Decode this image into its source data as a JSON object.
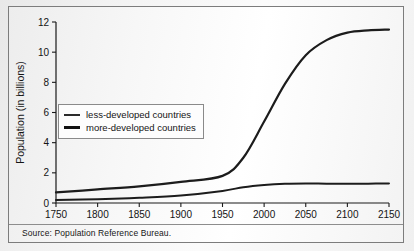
{
  "figure": {
    "source_note": "Source: Population Reference Bureau."
  },
  "chart_data": {
    "type": "line",
    "title": "",
    "xlabel": "",
    "ylabel": "Population (in billions)",
    "xlim": [
      1750,
      2150
    ],
    "ylim": [
      0,
      12
    ],
    "grid": false,
    "legend_position": "upper-left-inside",
    "xticks": [
      1750,
      1800,
      1850,
      1900,
      1950,
      2000,
      2050,
      2100,
      2150
    ],
    "yticks": [
      0,
      2,
      4,
      6,
      8,
      10,
      12
    ],
    "x": [
      1750,
      1800,
      1850,
      1900,
      1950,
      1975,
      2000,
      2025,
      2050,
      2075,
      2100,
      2125,
      2150
    ],
    "series": [
      {
        "name": "less-developed countries",
        "values": [
          0.7,
          0.9,
          1.1,
          1.4,
          1.8,
          3.0,
          5.4,
          7.9,
          9.8,
          10.8,
          11.3,
          11.45,
          11.5
        ]
      },
      {
        "name": "more-developed countries",
        "values": [
          0.2,
          0.25,
          0.35,
          0.5,
          0.8,
          1.05,
          1.2,
          1.28,
          1.3,
          1.28,
          1.27,
          1.28,
          1.3
        ]
      }
    ]
  }
}
